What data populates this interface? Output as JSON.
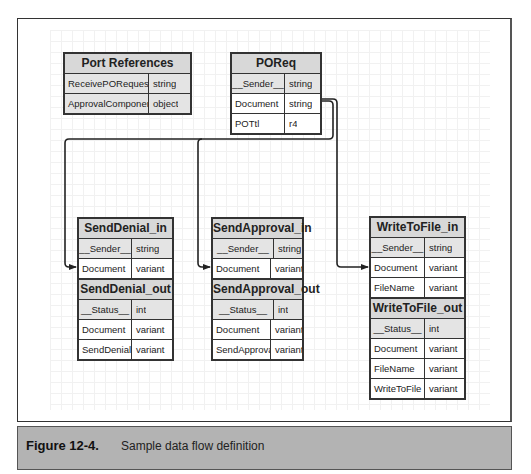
{
  "tables": {
    "port_references": {
      "title": "Port References",
      "rows": [
        {
          "name": "ReceivePORequest",
          "type": "string"
        },
        {
          "name": "ApprovalComponent",
          "type": "object"
        }
      ]
    },
    "poreq": {
      "title": "POReq",
      "rows": [
        {
          "name": "__Sender__",
          "type": "string"
        },
        {
          "name": "Document",
          "type": "string"
        },
        {
          "name": "POTtl",
          "type": "r4"
        }
      ]
    },
    "send_denial_in": {
      "title": "SendDenial_in",
      "rows": [
        {
          "name": "__Sender__",
          "type": "string"
        },
        {
          "name": "Document",
          "type": "variant"
        }
      ]
    },
    "send_denial_out": {
      "title": "SendDenial_out",
      "rows": [
        {
          "name": "__Status__",
          "type": "int"
        },
        {
          "name": "Document",
          "type": "variant"
        },
        {
          "name": "SendDenial",
          "type": "variant"
        }
      ]
    },
    "send_approval_in": {
      "title": "SendApproval_in",
      "rows": [
        {
          "name": "__Sender__",
          "type": "string"
        },
        {
          "name": "Document",
          "type": "variant"
        }
      ]
    },
    "send_approval_out": {
      "title": "SendApproval_out",
      "rows": [
        {
          "name": "__Status__",
          "type": "int"
        },
        {
          "name": "Document",
          "type": "variant"
        },
        {
          "name": "SendApproval",
          "type": "variant"
        }
      ]
    },
    "write_to_file_in": {
      "title": "WriteToFile_in",
      "rows": [
        {
          "name": "__Sender__",
          "type": "string"
        },
        {
          "name": "Document",
          "type": "variant"
        },
        {
          "name": "FileName",
          "type": "variant"
        }
      ]
    },
    "write_to_file_out": {
      "title": "WriteToFile_out",
      "rows": [
        {
          "name": "__Status__",
          "type": "int"
        },
        {
          "name": "Document",
          "type": "variant"
        },
        {
          "name": "FileName",
          "type": "variant"
        },
        {
          "name": "WriteToFile",
          "type": "variant"
        }
      ]
    }
  },
  "connections": [
    {
      "from": "POReq.Document",
      "to": "SendDenial_in.Document"
    },
    {
      "from": "POReq.Document",
      "to": "SendApproval_in.Document"
    },
    {
      "from": "POReq.Document",
      "to": "WriteToFile_in.Document"
    }
  ],
  "caption": {
    "number": "Figure 12-4.",
    "text": "Sample data flow definition"
  }
}
